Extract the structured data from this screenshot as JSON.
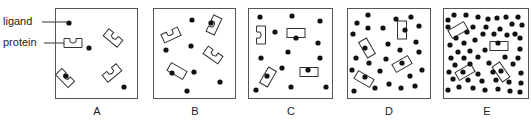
{
  "legend": {
    "ligand_label": "ligand",
    "protein_label": "protein"
  },
  "panels": [
    {
      "label": "A"
    },
    {
      "label": "B"
    },
    {
      "label": "C"
    },
    {
      "label": "D"
    },
    {
      "label": "E"
    }
  ],
  "colors": {
    "ligand": "#111111",
    "outline": "#555555",
    "background": "#ffffff"
  }
}
